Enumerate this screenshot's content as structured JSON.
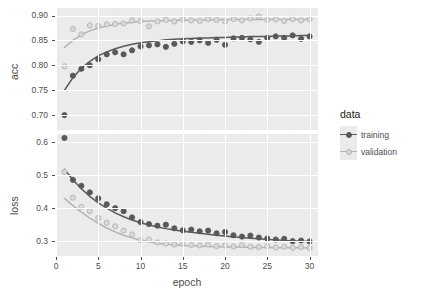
{
  "chart_data": {
    "type": "scatter",
    "title": "",
    "subtitle": "",
    "xlabel": "epoch",
    "ylabel": "",
    "grid": true,
    "legend_position": "right",
    "legend_title": "data",
    "facets": [
      {
        "name": "acc",
        "ylabel": "acc",
        "ylim": [
          0.67,
          0.915
        ],
        "yticks": [
          0.7,
          0.75,
          0.8,
          0.85,
          0.9
        ],
        "ytick_labels": [
          "0.70",
          "0.75",
          "0.80",
          "0.85",
          "0.90"
        ],
        "series": [
          {
            "name": "training",
            "color": "#595959",
            "fill": "#595959",
            "x": [
              1,
              2,
              3,
              4,
              5,
              6,
              7,
              8,
              9,
              10,
              11,
              12,
              13,
              14,
              15,
              16,
              17,
              18,
              19,
              20,
              21,
              22,
              23,
              24,
              25,
              26,
              27,
              28,
              29,
              30
            ],
            "values": [
              0.7,
              0.779,
              0.793,
              0.8,
              0.812,
              0.822,
              0.826,
              0.822,
              0.83,
              0.838,
              0.84,
              0.842,
              0.837,
              0.843,
              0.848,
              0.847,
              0.85,
              0.845,
              0.851,
              0.841,
              0.854,
              0.855,
              0.852,
              0.847,
              0.855,
              0.858,
              0.855,
              0.86,
              0.853,
              0.858
            ],
            "smooth": [
              0.75,
              0.775,
              0.794,
              0.808,
              0.819,
              0.827,
              0.833,
              0.838,
              0.842,
              0.845,
              0.847,
              0.849,
              0.851,
              0.852,
              0.853,
              0.854,
              0.855,
              0.855,
              0.856,
              0.856,
              0.857,
              0.857,
              0.858,
              0.858,
              0.858,
              0.859,
              0.859,
              0.859,
              0.86,
              0.86
            ]
          },
          {
            "name": "validation",
            "color": "#b3b3b3",
            "fill": "#d9d9d9",
            "x": [
              1,
              2,
              3,
              4,
              5,
              6,
              7,
              8,
              9,
              10,
              11,
              12,
              13,
              14,
              15,
              16,
              17,
              18,
              19,
              20,
              21,
              22,
              23,
              24,
              25,
              26,
              27,
              28,
              29,
              30
            ],
            "values": [
              0.798,
              0.873,
              0.862,
              0.88,
              0.879,
              0.882,
              0.883,
              0.884,
              0.89,
              0.889,
              0.878,
              0.888,
              0.891,
              0.888,
              0.892,
              0.89,
              0.889,
              0.893,
              0.891,
              0.888,
              0.893,
              0.89,
              0.894,
              0.898,
              0.891,
              0.892,
              0.889,
              0.893,
              0.89,
              0.892
            ],
            "smooth": [
              0.836,
              0.85,
              0.861,
              0.869,
              0.875,
              0.879,
              0.882,
              0.885,
              0.886,
              0.888,
              0.889,
              0.889,
              0.89,
              0.89,
              0.891,
              0.891,
              0.891,
              0.891,
              0.892,
              0.892,
              0.892,
              0.892,
              0.892,
              0.892,
              0.892,
              0.892,
              0.892,
              0.892,
              0.892,
              0.892
            ]
          }
        ]
      },
      {
        "name": "loss",
        "ylabel": "loss",
        "ylim": [
          0.255,
          0.625
        ],
        "yticks": [
          0.3,
          0.4,
          0.5,
          0.6
        ],
        "ytick_labels": [
          "0.3",
          "0.4",
          "0.5",
          "0.6"
        ],
        "series": [
          {
            "name": "training",
            "color": "#595959",
            "fill": "#595959",
            "x": [
              1,
              2,
              3,
              4,
              5,
              6,
              7,
              8,
              9,
              10,
              11,
              12,
              13,
              14,
              15,
              16,
              17,
              18,
              19,
              20,
              21,
              22,
              23,
              24,
              25,
              26,
              27,
              28,
              29,
              30
            ],
            "values": [
              0.613,
              0.486,
              0.468,
              0.448,
              0.43,
              0.412,
              0.4,
              0.391,
              0.372,
              0.358,
              0.352,
              0.347,
              0.35,
              0.339,
              0.333,
              0.335,
              0.33,
              0.332,
              0.324,
              0.328,
              0.318,
              0.314,
              0.317,
              0.311,
              0.308,
              0.305,
              0.307,
              0.3,
              0.302,
              0.299
            ],
            "smooth": [
              0.518,
              0.486,
              0.459,
              0.436,
              0.416,
              0.4,
              0.386,
              0.374,
              0.364,
              0.356,
              0.349,
              0.343,
              0.338,
              0.334,
              0.33,
              0.327,
              0.324,
              0.321,
              0.318,
              0.316,
              0.313,
              0.311,
              0.309,
              0.307,
              0.305,
              0.304,
              0.302,
              0.301,
              0.3,
              0.299
            ]
          },
          {
            "name": "validation",
            "color": "#b3b3b3",
            "fill": "#d9d9d9",
            "x": [
              1,
              2,
              3,
              4,
              5,
              6,
              7,
              8,
              9,
              10,
              11,
              12,
              13,
              14,
              15,
              16,
              17,
              18,
              19,
              20,
              21,
              22,
              23,
              24,
              25,
              26,
              27,
              28,
              29,
              30
            ],
            "values": [
              0.51,
              0.432,
              0.404,
              0.391,
              0.37,
              0.356,
              0.345,
              0.332,
              0.32,
              0.303,
              0.305,
              0.296,
              0.293,
              0.29,
              0.292,
              0.288,
              0.287,
              0.29,
              0.285,
              0.287,
              0.284,
              0.288,
              0.283,
              0.282,
              0.285,
              0.281,
              0.283,
              0.28,
              0.282,
              0.279
            ],
            "smooth": [
              0.43,
              0.408,
              0.388,
              0.37,
              0.354,
              0.34,
              0.328,
              0.318,
              0.31,
              0.303,
              0.298,
              0.294,
              0.291,
              0.289,
              0.287,
              0.286,
              0.285,
              0.284,
              0.283,
              0.283,
              0.282,
              0.282,
              0.281,
              0.281,
              0.281,
              0.28,
              0.28,
              0.28,
              0.28,
              0.279
            ]
          }
        ]
      }
    ],
    "xlim": [
      0,
      31
    ],
    "xticks": [
      0,
      5,
      10,
      15,
      20,
      25,
      30
    ],
    "xtick_labels": [
      "0",
      "5",
      "10",
      "15",
      "20",
      "25",
      "30"
    ]
  },
  "legend": {
    "title": "data",
    "items": [
      {
        "label": "training",
        "color": "#595959",
        "fill": "#595959"
      },
      {
        "label": "validation",
        "color": "#b3b3b3",
        "fill": "#d9d9d9"
      }
    ]
  },
  "theme": {
    "panel_background": "#ebebeb",
    "gridline_color": "#ffffff",
    "text_color": "#4d4d4d",
    "figure_background": "#ffffff"
  }
}
